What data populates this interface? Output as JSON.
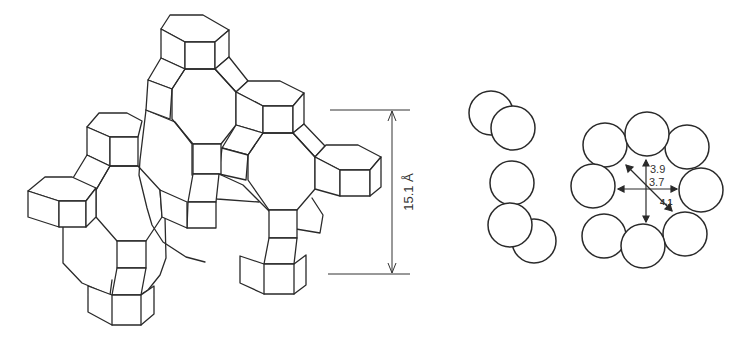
{
  "figure": {
    "framework": {
      "description": "zeolite framework structure (polyhedral cage linkage)",
      "dimension": {
        "label": "15.1 Å",
        "orientation": "vertical"
      }
    },
    "side_view": {
      "description": "8-ring pore, side view (stacked oxygen spheres)",
      "sphere_count": 5
    },
    "ring_view": {
      "description": "8-membered ring pore aperture, top view",
      "sphere_count": 8,
      "labels": {
        "diameter_a": "3.9",
        "diameter_b": "3.7",
        "diagonal": "4.1"
      }
    }
  },
  "colors": {
    "line": "#2a2a2a",
    "background": "#ffffff",
    "label": "#333333"
  }
}
